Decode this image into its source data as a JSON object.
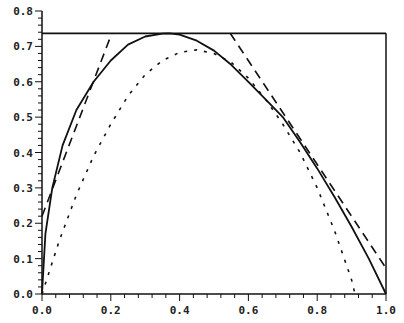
{
  "chart_data": {
    "type": "line",
    "title": "",
    "xlabel": "",
    "ylabel": "",
    "xlim": [
      0.0,
      1.0
    ],
    "ylim": [
      0.0,
      0.8
    ],
    "grid": false,
    "legend": null,
    "x_ticks": [
      "0.0",
      "0.2",
      "0.4",
      "0.6",
      "0.8",
      "1.0"
    ],
    "y_ticks": [
      "0.0",
      "0.1",
      "0.2",
      "0.3",
      "0.4",
      "0.5",
      "0.6",
      "0.7",
      "0.8"
    ],
    "series": [
      {
        "name": "solid-curve",
        "style": "solid",
        "x": [
          0.0,
          0.01,
          0.03,
          0.06,
          0.1,
          0.15,
          0.2,
          0.25,
          0.3,
          0.35,
          0.37,
          0.4,
          0.45,
          0.5,
          0.55,
          0.6,
          0.65,
          0.7,
          0.75,
          0.8,
          0.85,
          0.9,
          0.95,
          1.0
        ],
        "y": [
          0.0,
          0.17,
          0.3,
          0.42,
          0.52,
          0.6,
          0.66,
          0.705,
          0.728,
          0.736,
          0.737,
          0.733,
          0.716,
          0.688,
          0.648,
          0.6,
          0.55,
          0.5,
          0.43,
          0.355,
          0.275,
          0.19,
          0.1,
          0.0
        ]
      },
      {
        "name": "dotted-curve",
        "style": "dotted",
        "x": [
          0.0,
          0.02,
          0.05,
          0.1,
          0.15,
          0.2,
          0.25,
          0.3,
          0.35,
          0.4,
          0.45,
          0.5,
          0.55,
          0.6,
          0.65,
          0.7,
          0.75,
          0.8,
          0.85,
          0.9,
          0.91
        ],
        "y": [
          0.0,
          0.06,
          0.15,
          0.28,
          0.39,
          0.48,
          0.56,
          0.62,
          0.66,
          0.683,
          0.69,
          0.68,
          0.655,
          0.61,
          0.55,
          0.48,
          0.4,
          0.3,
          0.18,
          0.04,
          0.0
        ]
      },
      {
        "name": "left-tangent",
        "style": "dashed",
        "x": [
          0.0,
          0.203
        ],
        "y": [
          0.22,
          0.737
        ]
      },
      {
        "name": "right-tangent",
        "style": "dashed",
        "x": [
          0.547,
          1.0
        ],
        "y": [
          0.737,
          0.073
        ]
      },
      {
        "name": "max-line",
        "style": "solid",
        "x": [
          0.0,
          1.0
        ],
        "y": [
          0.737,
          0.737
        ]
      }
    ]
  }
}
